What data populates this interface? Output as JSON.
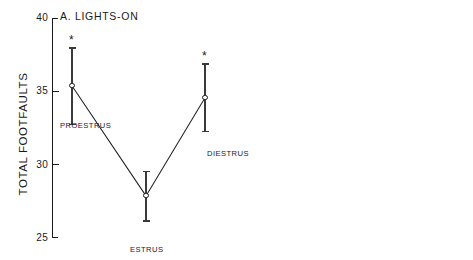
{
  "figure": {
    "ylabel": "TOTAL FOOTFAULTS",
    "significance_marker": "*"
  },
  "chart_data": [
    {
      "type": "line",
      "title": "A. LIGHTS-ON",
      "panel": "A",
      "xlabel": "",
      "ylabel": "TOTAL FOOTFAULTS",
      "ylim": [
        25,
        40
      ],
      "yticks": [
        25,
        30,
        35,
        40
      ],
      "ytick_labels": [
        "25",
        "30",
        "35",
        "40"
      ],
      "grid": false,
      "legend": "none",
      "marker_style": "open-circle",
      "categories": [
        "PROESTRUS",
        "ESTRUS",
        "DIESTRUS"
      ],
      "values": [
        35.4,
        27.9,
        34.6
      ],
      "err_upper": [
        2.6,
        1.7,
        2.3
      ],
      "err_lower": [
        2.6,
        1.7,
        2.3
      ],
      "significance": [
        true,
        false,
        true
      ]
    },
    {
      "type": "line",
      "title": "B. LIGHTS-OFF",
      "panel": "B",
      "xlabel": "",
      "ylabel": "TOTAL FOOTFAULTS",
      "ylim": [
        45,
        60
      ],
      "yticks": [
        45,
        50,
        55,
        60
      ],
      "ytick_labels": [
        "45",
        "50",
        "55",
        "60"
      ],
      "grid": false,
      "legend": "none",
      "marker_style": "filled-circle",
      "categories": [
        "PROESTRUS",
        "ESTRUS",
        "DIESTRUS"
      ],
      "values": [
        54.0,
        50.8,
        56.6
      ],
      "err_upper": [
        1.2,
        1.4,
        1.7
      ],
      "err_lower": [
        1.2,
        1.4,
        1.7
      ],
      "significance": [
        false,
        false,
        true
      ]
    }
  ]
}
